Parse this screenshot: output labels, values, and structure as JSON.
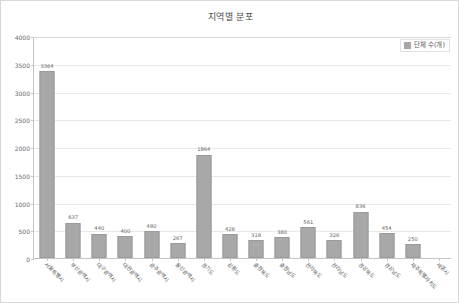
{
  "chart_data": {
    "type": "bar",
    "title": "지역별 분포",
    "xlabel": "",
    "ylabel": "",
    "ylim": [
      0,
      4000
    ],
    "ytick_labels": [
      "4000",
      "3500",
      "3000",
      "2500",
      "2000",
      "1500",
      "1000",
      "500",
      "0"
    ],
    "ytick_values": [
      4000,
      3500,
      3000,
      2500,
      2000,
      1500,
      1000,
      500,
      0
    ],
    "grid": true,
    "legend_position": "top-right",
    "legend": [
      "단체 수(개)"
    ],
    "series_color": "#a8a8a8",
    "categories": [
      "서울특별시",
      "부산광역시",
      "대구광역시",
      "대전광역시",
      "광주광역시",
      "울산광역시",
      "경기도",
      "강원도",
      "충청북도",
      "충청남도",
      "전라북도",
      "전라남도",
      "경상북도",
      "경상남도",
      "제주특별자치도",
      "세종시"
    ],
    "series": [
      {
        "name": "단체 수(개)",
        "values": [
          3364,
          637,
          440,
          400,
          480,
          267,
          1864,
          428,
          318,
          380,
          561,
          326,
          836,
          454,
          250,
          0
        ]
      }
    ],
    "data_labels": [
      "3364",
      "637",
      "440",
      "400",
      "480",
      "267",
      "1864",
      "428",
      "318",
      "380",
      "561",
      "326",
      "836",
      "454",
      "250",
      ""
    ]
  }
}
